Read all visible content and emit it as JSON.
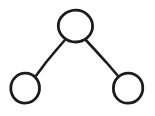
{
  "diagram": {
    "title": "Tree graph with three nodes",
    "type": "node-link-tree",
    "style": "hand-drawn ink sketch",
    "canvas": {
      "width": 155,
      "height": 116,
      "background_color": "#ffffff"
    },
    "stroke_color": "#1c1c1c",
    "node_fill_color": "#ffffff",
    "node_count": 3,
    "edge_count": 2,
    "nodes": [
      {
        "id": "root",
        "label": "",
        "role": "root",
        "cx": 75,
        "cy": 26,
        "rx": 17,
        "ry": 16
      },
      {
        "id": "left-child",
        "label": "",
        "role": "leaf",
        "cx": 25,
        "cy": 88,
        "rx": 14,
        "ry": 15
      },
      {
        "id": "right-child",
        "label": "",
        "role": "leaf",
        "cx": 128,
        "cy": 88,
        "rx": 14.5,
        "ry": 15
      }
    ],
    "edges": [
      {
        "id": "edge-root-left",
        "from": "root",
        "to": "left-child",
        "x1": 64,
        "y1": 40,
        "x2": 36,
        "y2": 76
      },
      {
        "id": "edge-root-right",
        "from": "root",
        "to": "right-child",
        "x1": 86,
        "y1": 40,
        "x2": 117,
        "y2": 75
      }
    ]
  }
}
